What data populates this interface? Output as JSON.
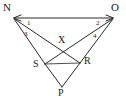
{
  "figure": {
    "type": "geometry-diagram",
    "stroke_color": "#2b2b2b",
    "background_color": "#ffffff",
    "vertices": [
      {
        "id": "N",
        "label": "N",
        "x": 14,
        "y": 18,
        "label_x": 4,
        "label_y": 2
      },
      {
        "id": "O",
        "label": "O",
        "x": 113,
        "y": 18,
        "label_x": 112,
        "label_y": 2
      },
      {
        "id": "X",
        "label": "X",
        "x": 63,
        "y": 45,
        "label_x": 59,
        "label_y": 36
      },
      {
        "id": "S",
        "label": "S",
        "x": 45,
        "y": 64,
        "label_x": 33,
        "label_y": 60
      },
      {
        "id": "R",
        "label": "R",
        "x": 80,
        "y": 63,
        "label_x": 84,
        "label_y": 57
      },
      {
        "id": "P",
        "label": "P",
        "x": 62,
        "y": 88,
        "label_x": 59,
        "label_y": 88
      }
    ],
    "angles": [
      {
        "id": "angle-1",
        "label": "1",
        "at_vertex": "N",
        "x": 28,
        "y": 20
      },
      {
        "id": "angle-2",
        "label": "2",
        "at_vertex": "O",
        "x": 97,
        "y": 20
      },
      {
        "id": "angle-3",
        "label": "3",
        "at_vertex": "N",
        "x": 24,
        "y": 32
      },
      {
        "id": "angle-4",
        "label": "4",
        "at_vertex": "O",
        "x": 94,
        "y": 34
      }
    ],
    "segments": [
      {
        "id": "segment-NO",
        "from": "N",
        "to": "O",
        "arrow_both_ends": true
      },
      {
        "id": "segment-NR",
        "from": "N",
        "to": "R",
        "arrow_both_ends": false
      },
      {
        "id": "segment-NS",
        "from": "N",
        "to": "S",
        "arrow_both_ends": false
      },
      {
        "id": "segment-OS",
        "from": "O",
        "to": "S",
        "arrow_both_ends": false
      },
      {
        "id": "segment-OR",
        "from": "O",
        "to": "R",
        "arrow_both_ends": false
      },
      {
        "id": "segment-SR",
        "from": "S",
        "to": "R",
        "arrow_both_ends": false
      },
      {
        "id": "segment-SP",
        "from": "S",
        "to": "P",
        "arrow_both_ends": false
      },
      {
        "id": "segment-RP",
        "from": "R",
        "to": "P",
        "arrow_both_ends": false
      }
    ]
  }
}
